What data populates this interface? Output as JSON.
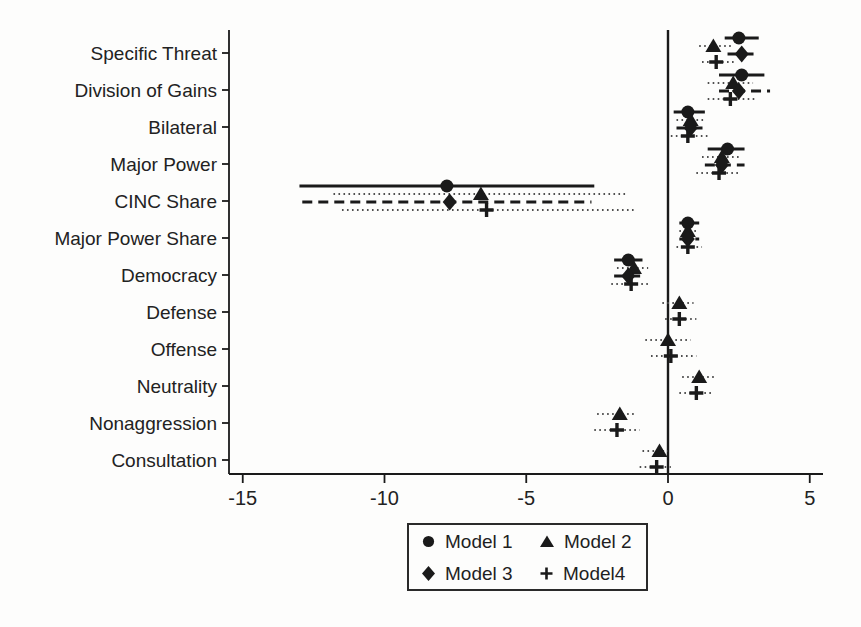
{
  "figure": {
    "kind": "scanned coefficient plot (dot-and-CI chart)",
    "colors": {
      "ink": "#1a1a1a",
      "dotted_gray": "#4f4f4f",
      "background": "#fdfdfc"
    }
  },
  "chart_data": {
    "type": "scatter",
    "subtype": "coefficient-dot-plot-with-confidence-intervals",
    "title": "",
    "xlabel": "",
    "ylabel": "",
    "grid": false,
    "legend_position": "bottom-center",
    "xlim": [
      -15.5,
      5.5
    ],
    "x_ticks": [
      -15,
      -10,
      -5,
      0,
      5
    ],
    "x_tick_labels": [
      "-15",
      "-10",
      "-5",
      "0",
      "5"
    ],
    "zero_reference_line_x": 0,
    "categories": [
      "Specific Threat",
      "Division of Gains",
      "Bilateral",
      "Major Power",
      "CINC Share",
      "Major Power Share",
      "Democracy",
      "Defense",
      "Offense",
      "Neutrality",
      "Nonaggression",
      "Consultation"
    ],
    "series": [
      {
        "name": "Model 1",
        "marker": "circle",
        "ci_style": "solid",
        "estimates": [
          2.5,
          2.6,
          0.7,
          2.1,
          -7.8,
          0.7,
          -1.4,
          null,
          null,
          null,
          null,
          null
        ],
        "ci_low": [
          2.0,
          1.8,
          0.2,
          1.4,
          -13.0,
          0.4,
          -1.9,
          null,
          null,
          null,
          null,
          null
        ],
        "ci_high": [
          3.2,
          3.4,
          1.3,
          2.7,
          -2.6,
          1.1,
          -0.9,
          null,
          null,
          null,
          null,
          null
        ]
      },
      {
        "name": "Model 2",
        "marker": "triangle",
        "ci_style": "dotted",
        "estimates": [
          1.6,
          2.3,
          0.8,
          1.9,
          -6.6,
          0.7,
          -1.2,
          0.4,
          0.0,
          1.1,
          -1.7,
          -0.3
        ],
        "ci_low": [
          1.1,
          1.4,
          0.3,
          1.2,
          -11.8,
          0.4,
          -1.8,
          -0.2,
          -0.8,
          0.5,
          -2.5,
          -0.9
        ],
        "ci_high": [
          2.3,
          3.0,
          1.3,
          2.6,
          -1.5,
          1.1,
          -0.7,
          0.9,
          0.8,
          1.7,
          -1.1,
          0.0
        ]
      },
      {
        "name": "Model 3",
        "marker": "diamond",
        "ci_style": "dashed",
        "estimates": [
          2.6,
          2.5,
          0.8,
          1.9,
          -7.7,
          0.7,
          -1.4,
          null,
          null,
          null,
          null,
          null
        ],
        "ci_low": [
          2.1,
          1.8,
          0.3,
          1.3,
          -12.9,
          0.4,
          -1.9,
          null,
          null,
          null,
          null,
          null
        ],
        "ci_high": [
          3.2,
          3.6,
          1.4,
          2.7,
          -2.7,
          1.1,
          -0.8,
          null,
          null,
          null,
          null,
          null
        ]
      },
      {
        "name": "Model4",
        "marker": "plus",
        "ci_style": "dotted",
        "estimates": [
          1.7,
          2.2,
          0.7,
          1.8,
          -6.4,
          0.7,
          -1.3,
          0.4,
          0.1,
          1.0,
          -1.8,
          -0.4
        ],
        "ci_low": [
          1.2,
          1.4,
          0.1,
          1.0,
          -11.5,
          0.3,
          -2.0,
          -0.1,
          -0.6,
          0.4,
          -2.6,
          -1.0
        ],
        "ci_high": [
          2.4,
          3.1,
          1.4,
          2.5,
          -1.2,
          1.2,
          -0.6,
          1.0,
          1.0,
          1.6,
          -1.0,
          0.1
        ]
      }
    ]
  }
}
